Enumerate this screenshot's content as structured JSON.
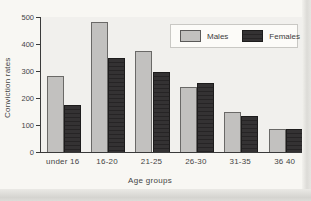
{
  "figure": {
    "background_color": "#f8f7f3",
    "plot_background_color": "#f1f0ed",
    "axis_color": "#3a3a3a"
  },
  "chart_data": {
    "type": "bar",
    "title": "",
    "categories": [
      "under 16",
      "16-20",
      "21-25",
      "26-30",
      "31-35",
      "36 40"
    ],
    "series": [
      {
        "name": "Males",
        "color": "#c2c1bf",
        "values": [
          280,
          480,
          375,
          240,
          150,
          85
        ]
      },
      {
        "name": "Females",
        "color": "#2f2d2e",
        "values": [
          175,
          350,
          295,
          255,
          135,
          85
        ]
      }
    ],
    "xlabel": "Age groups",
    "ylabel": "Conviction rates",
    "ylim": [
      0,
      500
    ],
    "yticks": [
      0,
      100,
      200,
      300,
      400,
      500
    ],
    "grid": false,
    "legend_position": "top-right"
  }
}
